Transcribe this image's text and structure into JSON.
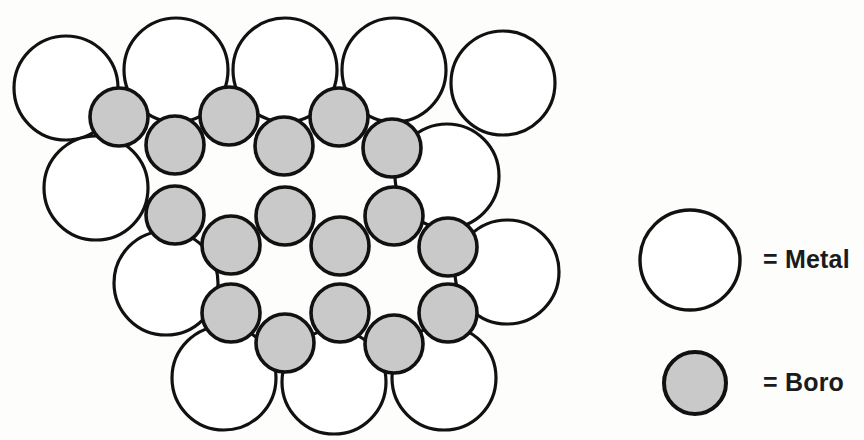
{
  "figure": {
    "background_color": "#fdfdfc",
    "width": 864,
    "height": 440
  },
  "colors": {
    "metal_fill": "#ffffff",
    "boro_fill": "#c9c9c9",
    "outline": "#111111",
    "text": "#1b1b1b"
  },
  "structure": {
    "metal_radius": 52,
    "boro_radius": 29,
    "metal_atoms": [
      {
        "id": "metal-top-1",
        "cx": 66,
        "cy": 88
      },
      {
        "id": "metal-top-2",
        "cx": 176,
        "cy": 70
      },
      {
        "id": "metal-top-3",
        "cx": 285,
        "cy": 70
      },
      {
        "id": "metal-top-4",
        "cx": 394,
        "cy": 70
      },
      {
        "id": "metal-top-5",
        "cx": 503,
        "cy": 83
      },
      {
        "id": "metal-left-1",
        "cx": 96,
        "cy": 188
      },
      {
        "id": "metal-left-2",
        "cx": 166,
        "cy": 283
      },
      {
        "id": "metal-right-1",
        "cx": 447,
        "cy": 176
      },
      {
        "id": "metal-right-2",
        "cx": 507,
        "cy": 272
      },
      {
        "id": "metal-bottom-1",
        "cx": 224,
        "cy": 378
      },
      {
        "id": "metal-bottom-2",
        "cx": 334,
        "cy": 382
      },
      {
        "id": "metal-bottom-3",
        "cx": 444,
        "cy": 378
      }
    ],
    "boro_atoms": [
      {
        "id": "boro-r1-a",
        "cx": 119,
        "cy": 117
      },
      {
        "id": "boro-r1-b",
        "cx": 175,
        "cy": 145
      },
      {
        "id": "boro-r1-c",
        "cx": 229,
        "cy": 116
      },
      {
        "id": "boro-r1-d",
        "cx": 284,
        "cy": 146
      },
      {
        "id": "boro-r1-e",
        "cx": 339,
        "cy": 117
      },
      {
        "id": "boro-r1-f",
        "cx": 392,
        "cy": 148
      },
      {
        "id": "boro-r2-a",
        "cx": 175,
        "cy": 215
      },
      {
        "id": "boro-r2-b",
        "cx": 231,
        "cy": 245
      },
      {
        "id": "boro-r2-c",
        "cx": 285,
        "cy": 216
      },
      {
        "id": "boro-r2-d",
        "cx": 340,
        "cy": 246
      },
      {
        "id": "boro-r2-e",
        "cx": 394,
        "cy": 216
      },
      {
        "id": "boro-r2-f",
        "cx": 448,
        "cy": 247
      },
      {
        "id": "boro-r3-a",
        "cx": 231,
        "cy": 313
      },
      {
        "id": "boro-r3-b",
        "cx": 285,
        "cy": 343
      },
      {
        "id": "boro-r3-c",
        "cx": 340,
        "cy": 313
      },
      {
        "id": "boro-r3-d",
        "cx": 394,
        "cy": 344
      },
      {
        "id": "boro-r3-e",
        "cx": 448,
        "cy": 313
      }
    ]
  },
  "legend": {
    "items": [
      {
        "key": "metal",
        "label": "= Metal",
        "swatch_type": "circle-open",
        "swatch_cx": 690,
        "swatch_cy": 260,
        "swatch_r": 50,
        "label_x": 763,
        "label_y": 261
      },
      {
        "key": "boro",
        "label": "= Boro",
        "swatch_type": "circle-filled",
        "swatch_cx": 695,
        "swatch_cy": 383,
        "swatch_r": 31,
        "label_x": 763,
        "label_y": 384
      }
    ]
  }
}
